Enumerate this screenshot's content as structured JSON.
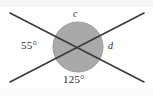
{
  "figure": {
    "type": "geometry-diagram",
    "background_color": "#ffffff",
    "circle": {
      "name": "shaded-circle",
      "center_x": 78,
      "center_y": 47,
      "radius": 25,
      "fill_color": "#a9a9a9",
      "stroke_color": "#9a9a9a"
    },
    "lines": [
      {
        "name": "line-upper-left-to-lower-right",
        "x1": 10,
        "y1": 13,
        "x2": 144,
        "y2": 82,
        "color": "#3a3a3a",
        "width": 1.6
      },
      {
        "name": "line-lower-left-to-upper-right",
        "x1": 10,
        "y1": 82,
        "x2": 144,
        "y2": 13,
        "color": "#3a3a3a",
        "width": 1.6
      }
    ],
    "intersection": {
      "x": 78,
      "y": 47
    },
    "labels": {
      "left_angle": "55°",
      "bottom_angle": "125°",
      "top_angle": "c",
      "right_angle": "d"
    }
  }
}
